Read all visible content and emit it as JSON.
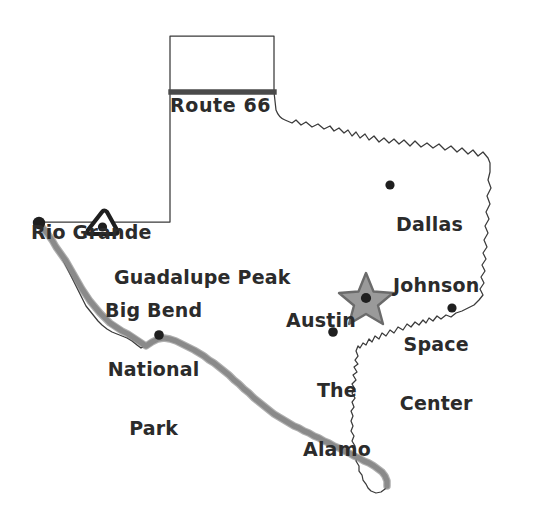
{
  "map": {
    "title": "Texas landmarks map",
    "style": "hand-drawn sketch",
    "colors": {
      "outline": "#3a3a3a",
      "ink": "#2b2b2b",
      "river": "#8a8a8a",
      "river_shadow": "#6e6e6e",
      "star_fill": "#9a9a9a",
      "star_outline": "#6b6b6b",
      "marker_dot": "#1f1f1f",
      "highway": "#4a4a4a",
      "background": "#ffffff"
    },
    "labels": [
      {
        "id": "route-66",
        "text": "Route 66",
        "lines": [
          "Route 66"
        ],
        "marker": "highway-line"
      },
      {
        "id": "rio-grande",
        "text": "Rio Grande",
        "lines": [
          "Rio Grande"
        ],
        "marker": "river-line"
      },
      {
        "id": "guadalupe-peak",
        "text": "Guadalupe Peak",
        "lines": [
          "Guadalupe Peak"
        ],
        "marker": "mountain-triangle"
      },
      {
        "id": "big-bend",
        "text": "Big Bend National Park",
        "lines": [
          "Big Bend",
          "National",
          "Park"
        ],
        "marker": "dot"
      },
      {
        "id": "dallas",
        "text": "Dallas",
        "lines": [
          "Dallas"
        ],
        "marker": "dot"
      },
      {
        "id": "johnson-space-center",
        "text": "Johnson Space Center",
        "lines": [
          "Johnson",
          "Space",
          "Center"
        ],
        "marker": "dot"
      },
      {
        "id": "austin",
        "text": "Austin",
        "lines": [
          "Austin"
        ],
        "marker": "star"
      },
      {
        "id": "the-alamo",
        "text": "The Alamo",
        "lines": [
          "The",
          "Alamo"
        ],
        "marker": "dot"
      }
    ],
    "text": {
      "route66": "Route 66",
      "rio_grande": "Rio Grande",
      "guadalupe_peak": "Guadalupe Peak",
      "big_bend_1": "Big Bend",
      "big_bend_2": "National",
      "big_bend_3": "Park",
      "dallas": "Dallas",
      "johnson_1": "Johnson",
      "johnson_2": "Space",
      "johnson_3": "Center",
      "austin": "Austin",
      "alamo_1": "The",
      "alamo_2": "Alamo"
    }
  }
}
